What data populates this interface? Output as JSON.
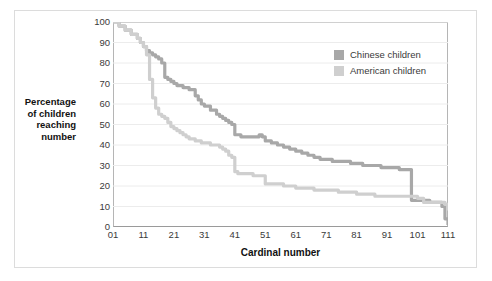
{
  "chart_data": {
    "type": "line",
    "title": "",
    "xlabel": "Cardinal number",
    "ylabel": "Percentage of children reaching number",
    "ylabel_lines": [
      "Percentage",
      "of children",
      "reaching",
      "number"
    ],
    "xlim": [
      1,
      111
    ],
    "ylim": [
      0,
      100
    ],
    "grid": true,
    "grid_axis": "y",
    "legend_position": "upper right",
    "xticks": [
      "01",
      "11",
      "21",
      "31",
      "41",
      "51",
      "61",
      "71",
      "81",
      "91",
      "101",
      "111"
    ],
    "xtick_values": [
      1,
      11,
      21,
      31,
      41,
      51,
      61,
      71,
      81,
      91,
      101,
      111
    ],
    "yticks": [
      "0",
      "10",
      "20",
      "30",
      "40",
      "50",
      "60",
      "70",
      "80",
      "90",
      "100"
    ],
    "ytick_values": [
      0,
      10,
      20,
      30,
      40,
      50,
      60,
      70,
      80,
      90,
      100
    ],
    "series": [
      {
        "name": "Chinese children",
        "color": "#a8a8a8",
        "x": [
          1,
          3,
          5,
          7,
          9,
          10,
          11,
          12,
          13,
          14,
          15,
          16,
          17,
          18,
          19,
          20,
          21,
          22,
          24,
          26,
          28,
          29,
          30,
          31,
          33,
          35,
          36,
          37,
          38,
          39,
          40,
          41,
          43,
          45,
          47,
          49,
          50,
          51,
          53,
          55,
          57,
          59,
          61,
          63,
          65,
          67,
          69,
          71,
          73,
          75,
          77,
          79,
          81,
          83,
          85,
          87,
          89,
          91,
          93,
          95,
          97,
          98,
          99,
          101,
          103,
          105,
          107,
          109,
          110,
          111
        ],
        "y": [
          100,
          98,
          96,
          94,
          92,
          90,
          88,
          86,
          85,
          84,
          83,
          82,
          80,
          73,
          72,
          71,
          70,
          69,
          68,
          67,
          64,
          62,
          60,
          59,
          57,
          55,
          54,
          53,
          52,
          51,
          50,
          45,
          44,
          44,
          44,
          45,
          44,
          42,
          41,
          40,
          39,
          38,
          37,
          36,
          35,
          34,
          33,
          33,
          32,
          32,
          32,
          31,
          31,
          30,
          30,
          30,
          29,
          29,
          29,
          28,
          28,
          28,
          13,
          13,
          13,
          12,
          12,
          10,
          4,
          1
        ]
      },
      {
        "name": "American children",
        "color": "#cfcfcf",
        "x": [
          1,
          3,
          5,
          7,
          9,
          10,
          11,
          12,
          13,
          14,
          15,
          16,
          17,
          18,
          19,
          20,
          21,
          22,
          23,
          24,
          25,
          26,
          27,
          28,
          29,
          30,
          31,
          33,
          35,
          36,
          37,
          38,
          39,
          40,
          41,
          42,
          43,
          45,
          47,
          49,
          50,
          51,
          53,
          55,
          57,
          59,
          61,
          63,
          65,
          67,
          69,
          71,
          73,
          75,
          77,
          79,
          81,
          83,
          85,
          87,
          89,
          91,
          93,
          95,
          97,
          99,
          101,
          103,
          105,
          107,
          109,
          110,
          111
        ],
        "y": [
          100,
          98,
          96,
          94,
          92,
          90,
          88,
          84,
          72,
          63,
          58,
          55,
          54,
          53,
          51,
          49,
          48,
          47,
          46,
          45,
          44,
          43,
          43,
          42,
          42,
          41,
          41,
          40,
          40,
          39,
          38,
          37,
          35,
          34,
          27,
          26,
          26,
          26,
          25,
          25,
          25,
          21,
          21,
          21,
          20,
          20,
          19,
          19,
          19,
          18,
          18,
          18,
          18,
          17,
          17,
          17,
          16,
          16,
          16,
          15,
          15,
          15,
          15,
          15,
          15,
          15,
          14,
          12,
          12,
          12,
          12,
          11,
          8
        ]
      }
    ]
  },
  "legend": {
    "items": [
      {
        "label": "Chinese children",
        "color": "#a8a8a8"
      },
      {
        "label": "American children",
        "color": "#cfcfcf"
      }
    ]
  }
}
